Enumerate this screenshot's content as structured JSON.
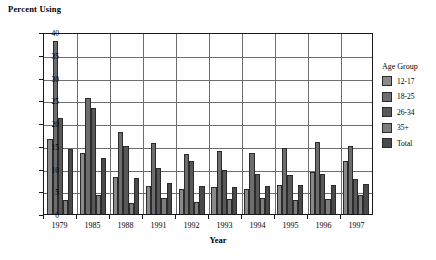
{
  "chart_data": {
    "type": "bar",
    "title": "",
    "ylabel": "Percent Using",
    "xlabel": "Year",
    "ylim": [
      0,
      40
    ],
    "yticks": [
      0,
      5,
      10,
      15,
      20,
      25,
      30,
      35,
      40
    ],
    "grid": true,
    "legend_position": "right",
    "legend_title": "Age Group",
    "categories": [
      "1979",
      "1985",
      "1988",
      "1991",
      "1992",
      "1993",
      "1994",
      "1995",
      "1996",
      "1997"
    ],
    "series": [
      {
        "name": "12-17",
        "color": "#8a8a8a",
        "values": [
          16.5,
          13.4,
          8.2,
          6.1,
          5.5,
          5.9,
          5.6,
          6.3,
          9.3,
          11.7
        ]
      },
      {
        "name": "18-25",
        "color": "#6d6d6d",
        "values": [
          38.0,
          25.5,
          18.0,
          15.6,
          13.3,
          13.9,
          13.4,
          14.5,
          15.9,
          15.0
        ]
      },
      {
        "name": "26-34",
        "color": "#585858",
        "values": [
          21.0,
          23.3,
          15.0,
          10.2,
          11.6,
          9.6,
          8.7,
          8.6,
          8.7,
          7.8
        ]
      },
      {
        "name": "35+",
        "color": "#7d7d7d",
        "values": [
          3.0,
          4.2,
          2.5,
          3.6,
          2.6,
          3.2,
          3.5,
          3.1,
          3.2,
          4.1
        ]
      },
      {
        "name": "Total",
        "color": "#4a4a4a",
        "values": [
          14.2,
          12.3,
          7.9,
          6.8,
          6.1,
          6.0,
          6.2,
          6.4,
          6.3,
          6.6
        ]
      }
    ]
  }
}
